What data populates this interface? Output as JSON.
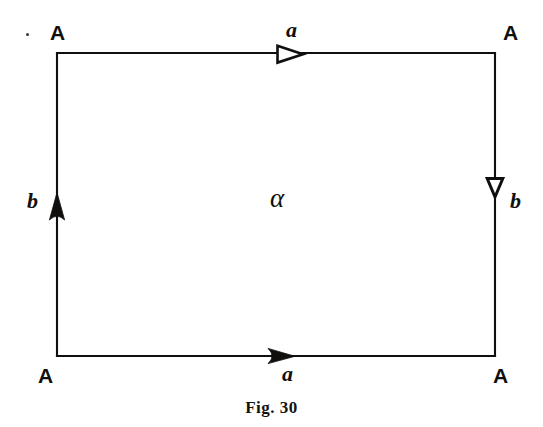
{
  "figure": {
    "caption": "Fig. 30",
    "background_color": "#ffffff",
    "ink_color": "#100f0d",
    "width": 543,
    "height": 427
  },
  "square": {
    "left": 57,
    "right": 495,
    "top": 53,
    "bottom": 356,
    "stroke_width": 2
  },
  "vertices": [
    {
      "id": "top-left",
      "label": "A",
      "x": 57,
      "y": 33
    },
    {
      "id": "top-right",
      "label": "A",
      "x": 510,
      "y": 33
    },
    {
      "id": "bottom-left",
      "label": "A",
      "x": 45,
      "y": 376
    },
    {
      "id": "bottom-right",
      "label": "A",
      "x": 500,
      "y": 376
    }
  ],
  "edges": [
    {
      "id": "top",
      "label": "a",
      "label_x": 292,
      "label_y": 31,
      "arrow_style": "hollow",
      "arrow_direction": "right",
      "arrow_x": 290,
      "arrow_y": 54
    },
    {
      "id": "bottom",
      "label": "a",
      "label_x": 288,
      "label_y": 376,
      "arrow_style": "filled",
      "arrow_direction": "right",
      "arrow_x": 282,
      "arrow_y": 356
    },
    {
      "id": "left",
      "label": "b",
      "label_x": 33,
      "label_y": 203,
      "arrow_style": "filled",
      "arrow_direction": "up",
      "arrow_x": 57,
      "arrow_y": 206
    },
    {
      "id": "right",
      "label": "b",
      "label_x": 516,
      "label_y": 204,
      "arrow_style": "hollow",
      "arrow_direction": "down",
      "arrow_x": 495,
      "arrow_y": 189
    }
  ],
  "region": {
    "label": "α",
    "x": 283,
    "y": 200
  },
  "artifacts": [
    {
      "id": "ink-speck",
      "x": 26,
      "y": 33
    }
  ]
}
